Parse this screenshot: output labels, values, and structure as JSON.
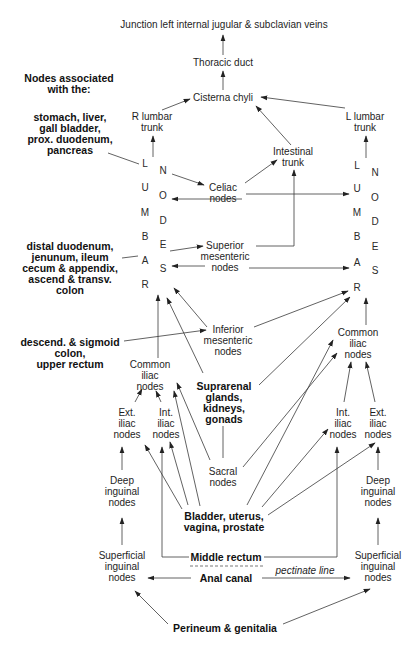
{
  "header": {
    "lines": [
      "Nodes associated",
      "with the:"
    ]
  },
  "trunks": {
    "junction": "Junction left internal jugular & subclavian veins",
    "thoracic_duct": "Thoracic duct",
    "cisterna_chyli": "Cisterna chyli",
    "r_lumbar_trunk": [
      "R lumbar",
      "trunk"
    ],
    "l_lumbar_trunk": [
      "L lumbar",
      "trunk"
    ],
    "intestinal_trunk": [
      "Intestinal",
      "trunk"
    ]
  },
  "lumbar_nodes": {
    "left": {
      "lumbar": [
        "L",
        "U",
        "M",
        "B",
        "A",
        "R"
      ],
      "nodes": [
        "N",
        "O",
        "D",
        "E",
        "S"
      ]
    },
    "right": {
      "lumbar": [
        "L",
        "U",
        "M",
        "B",
        "A",
        "R"
      ],
      "nodes": [
        "N",
        "O",
        "D",
        "E",
        "S"
      ]
    }
  },
  "nodes": {
    "celiac": [
      "Celiac",
      "nodes"
    ],
    "superior_mesenteric": [
      "Superior",
      "mesenteric",
      "nodes"
    ],
    "inferior_mesenteric": [
      "Inferior",
      "mesenteric",
      "nodes"
    ],
    "left_common_iliac": [
      "Common",
      "iliac",
      "nodes"
    ],
    "right_common_iliac": [
      "Common",
      "iliac",
      "nodes"
    ],
    "left_ext_iliac": [
      "Ext.",
      "iliac",
      "nodes"
    ],
    "left_int_iliac": [
      "Int.",
      "iliac",
      "nodes"
    ],
    "right_int_iliac": [
      "Int.",
      "iliac",
      "nodes"
    ],
    "right_ext_iliac": [
      "Ext.",
      "iliac",
      "nodes"
    ],
    "sacral": [
      "Sacral",
      "nodes"
    ],
    "left_deep_inguinal": [
      "Deep",
      "inguinal",
      "nodes"
    ],
    "right_deep_inguinal": [
      "Deep",
      "inguinal",
      "nodes"
    ],
    "left_superficial_inguinal": [
      "Superficial",
      "inguinal",
      "nodes"
    ],
    "right_superficial_inguinal": [
      "Superficial",
      "inguinal",
      "nodes"
    ]
  },
  "organs": {
    "upper_gi": [
      "stomach, liver,",
      "gall bladder,",
      "prox. duodenum,",
      "pancreas"
    ],
    "midgut": [
      "distal duodenum,",
      "jenunum, ileum",
      "cecum & appendix,",
      "ascend & transv.",
      "colon"
    ],
    "hindgut": [
      "descend. & sigmoid",
      "colon,",
      "upper rectum"
    ],
    "suprarenal": [
      "Suprarenal",
      "glands,",
      "kidneys,",
      "gonads"
    ],
    "pelvic": [
      "Bladder, uterus,",
      "vagina, prostate"
    ],
    "middle_rectum": "Middle rectum",
    "anal_canal": "Anal canal",
    "pectinate_line": "pectinate line",
    "perineum": "Perineum & genitalia"
  },
  "connections": [
    [
      "Thoracic duct",
      "Junction left internal jugular & subclavian veins"
    ],
    [
      "Cisterna chyli",
      "Thoracic duct"
    ],
    [
      "R lumbar trunk",
      "Cisterna chyli"
    ],
    [
      "L lumbar trunk",
      "Cisterna chyli"
    ],
    [
      "Intestinal trunk",
      "Cisterna chyli"
    ],
    [
      "Left lumbar nodes",
      "R lumbar trunk"
    ],
    [
      "Right lumbar nodes",
      "L lumbar trunk"
    ],
    [
      "stomach, liver, gall bladder, prox. duodenum, pancreas",
      "Celiac nodes"
    ],
    [
      "Celiac nodes",
      "Intestinal trunk"
    ],
    [
      "Celiac nodes",
      "Left lumbar nodes"
    ],
    [
      "Celiac nodes",
      "Right lumbar nodes"
    ],
    [
      "distal duodenum, jenunum, ileum, cecum & appendix, ascend & transv. colon",
      "Superior mesenteric nodes"
    ],
    [
      "Superior mesenteric nodes",
      "Intestinal trunk"
    ],
    [
      "Superior mesenteric nodes",
      "Left lumbar nodes"
    ],
    [
      "Superior mesenteric nodes",
      "Right lumbar nodes"
    ],
    [
      "descend. & sigmoid colon, upper rectum",
      "Inferior mesenteric nodes"
    ],
    [
      "Inferior mesenteric nodes",
      "Left lumbar nodes"
    ],
    [
      "Inferior mesenteric nodes",
      "Right lumbar nodes"
    ],
    [
      "Suprarenal glands, kidneys, gonads",
      "Left lumbar nodes"
    ],
    [
      "Suprarenal glands, kidneys, gonads",
      "Right lumbar nodes"
    ],
    [
      "Left common iliac nodes",
      "Left lumbar nodes"
    ],
    [
      "Right common iliac nodes",
      "Right lumbar nodes"
    ],
    [
      "Left ext. iliac nodes",
      "Left common iliac nodes"
    ],
    [
      "Left int. iliac nodes",
      "Left common iliac nodes"
    ],
    [
      "Right int. iliac nodes",
      "Right common iliac nodes"
    ],
    [
      "Right ext. iliac nodes",
      "Right common iliac nodes"
    ],
    [
      "Sacral nodes",
      "Left common iliac nodes"
    ],
    [
      "Sacral nodes",
      "Right common iliac nodes"
    ],
    [
      "Bladder, uterus, vagina, prostate",
      "Left ext. iliac nodes"
    ],
    [
      "Bladder, uterus, vagina, prostate",
      "Left int. iliac nodes"
    ],
    [
      "Bladder, uterus, vagina, prostate",
      "Left common iliac nodes"
    ],
    [
      "Bladder, uterus, vagina, prostate",
      "Right common iliac nodes"
    ],
    [
      "Bladder, uterus, vagina, prostate",
      "Right int. iliac nodes"
    ],
    [
      "Bladder, uterus, vagina, prostate",
      "Right ext. iliac nodes"
    ],
    [
      "Left deep inguinal nodes",
      "Left ext. iliac nodes"
    ],
    [
      "Right deep inguinal nodes",
      "Right ext. iliac nodes"
    ],
    [
      "Left superficial inguinal nodes",
      "Left deep inguinal nodes"
    ],
    [
      "Right superficial inguinal nodes",
      "Right deep inguinal nodes"
    ],
    [
      "Middle rectum",
      "Left int. iliac nodes"
    ],
    [
      "Middle rectum",
      "Right int. iliac nodes"
    ],
    [
      "Anal canal",
      "Left superficial inguinal nodes"
    ],
    [
      "Anal canal",
      "Right superficial inguinal nodes"
    ],
    [
      "Perineum & genitalia",
      "Left superficial inguinal nodes"
    ],
    [
      "Perineum & genitalia",
      "Right superficial inguinal nodes"
    ]
  ]
}
